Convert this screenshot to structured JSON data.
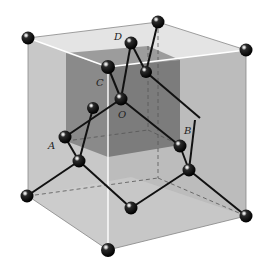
{
  "diagram": {
    "colors": {
      "background": "#ffffff",
      "outer_left_face": "#c9c9c9",
      "outer_right_face": "#bdbdbd",
      "outer_top_face": "#e6e6e6",
      "outer_bottom_face": "#d2d2d2",
      "inner_cube_left": "#8d8d8d",
      "inner_cube_right": "#7e7e7e",
      "inner_cube_top": "#a3a3a3",
      "bond": "#111111",
      "atom": "#0a0a0a",
      "edge_highlight": "#ffffff",
      "hidden_edge": "#555555"
    },
    "labels": [
      {
        "id": "D",
        "text": "D",
        "x": 117,
        "y": 40
      },
      {
        "id": "C",
        "text": "C",
        "x": 96,
        "y": 86
      },
      {
        "id": "O",
        "text": "O",
        "x": 118,
        "y": 118
      },
      {
        "id": "A",
        "text": "A",
        "x": 48,
        "y": 149
      },
      {
        "id": "B",
        "text": "B",
        "x": 184,
        "y": 134
      }
    ],
    "atoms": [
      {
        "id": "corner-top-left",
        "x": 28,
        "y": 38
      },
      {
        "id": "corner-top-back",
        "x": 158,
        "y": 22
      },
      {
        "id": "corner-top-right",
        "x": 246,
        "y": 50
      },
      {
        "id": "atom-D",
        "x": 131,
        "y": 43
      },
      {
        "id": "atom-C",
        "x": 108,
        "y": 67
      },
      {
        "id": "atom-face-top",
        "x": 146,
        "y": 72
      },
      {
        "id": "atom-O",
        "x": 121,
        "y": 99
      },
      {
        "id": "atom-left-inner",
        "x": 93,
        "y": 108
      },
      {
        "id": "atom-A",
        "x": 65,
        "y": 137
      },
      {
        "id": "atom-below-A",
        "x": 79,
        "y": 161
      },
      {
        "id": "atom-B",
        "x": 180,
        "y": 146
      },
      {
        "id": "atom-below-B",
        "x": 189,
        "y": 170
      },
      {
        "id": "corner-bottom-left",
        "x": 27,
        "y": 196
      },
      {
        "id": "atom-bottom-center",
        "x": 131,
        "y": 208
      },
      {
        "id": "corner-bottom-front",
        "x": 108,
        "y": 250
      },
      {
        "id": "corner-bottom-right",
        "x": 246,
        "y": 216
      }
    ]
  }
}
